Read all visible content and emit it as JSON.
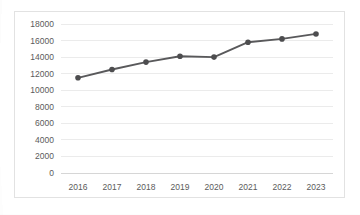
{
  "chart_data": {
    "type": "line",
    "title": "",
    "subtitle": "",
    "xlabel": "",
    "ylabel": "",
    "categories": [
      "2016",
      "2017",
      "2018",
      "2019",
      "2020",
      "2021",
      "2022",
      "2023"
    ],
    "values": [
      11500,
      12500,
      13400,
      14100,
      14000,
      15800,
      16200,
      16800
    ],
    "series": [
      {
        "name": "",
        "values": [
          11500,
          12500,
          13400,
          14100,
          14000,
          15800,
          16200,
          16800
        ]
      }
    ],
    "ylim": [
      0,
      18000
    ],
    "yticks": [
      0,
      2000,
      4000,
      6000,
      8000,
      10000,
      12000,
      14000,
      16000,
      18000
    ],
    "ytick_labels": [
      "0",
      "2000",
      "4000",
      "6000",
      "8000",
      "10000",
      "12000",
      "14000",
      "16000",
      "18000"
    ],
    "xtick_labels": [
      "2016",
      "2017",
      "2018",
      "2019",
      "2020",
      "2021",
      "2022",
      "2023"
    ],
    "grid": true,
    "grid_axis": "y",
    "legend": false,
    "legend_position": "none",
    "annotations": [],
    "line_color": "#59595b",
    "marker_color": "#4d4d4f",
    "marker_shape": "circle",
    "gridline_color": "#ebebeb",
    "axis_color": "#d6d6d6",
    "label_color": "#5b5b5b",
    "frame_color": "#e2e2e2",
    "background_color": "#ffffff"
  }
}
